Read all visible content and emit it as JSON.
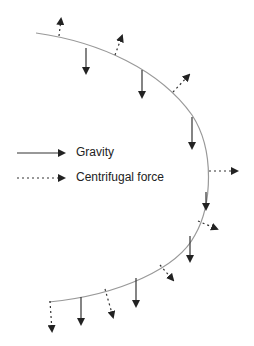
{
  "diagram": {
    "type": "force-diagram",
    "colors": {
      "curve": "#999999",
      "gravity": "#333333",
      "centrifugal": "#333333",
      "background": "#ffffff"
    }
  },
  "legend": {
    "items": [
      {
        "label": "Gravity",
        "style": "solid-arrow"
      },
      {
        "label": "Centrifugal force",
        "style": "dotted-arrow"
      }
    ]
  }
}
